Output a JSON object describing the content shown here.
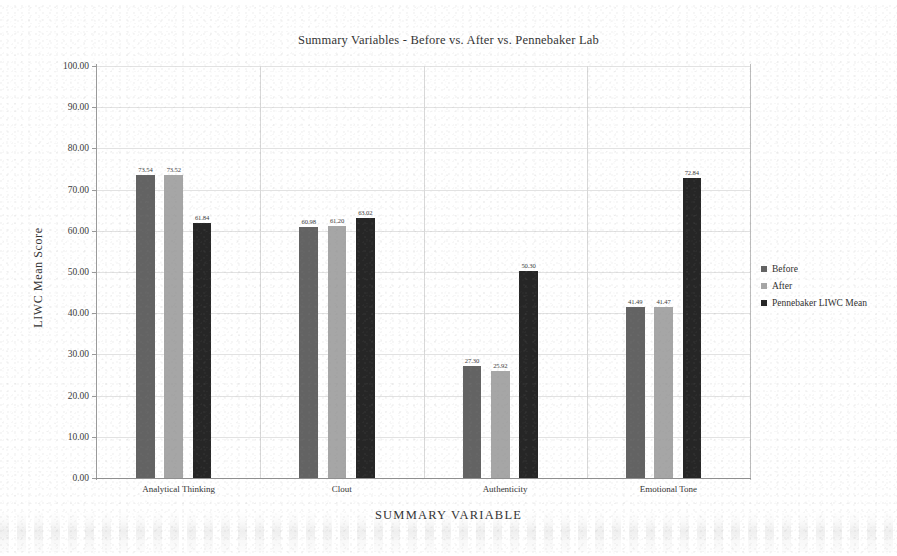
{
  "chart_data": {
    "type": "bar",
    "title": "Summary Variables - Before vs. After vs. Pennebaker Lab",
    "xlabel": "SUMMARY VARIABLE",
    "ylabel": "LIWC Mean Score",
    "categories": [
      "Analytical Thinking",
      "Clout",
      "Authenticity",
      "Emotional Tone"
    ],
    "series": [
      {
        "name": "Before",
        "color": "#636363",
        "values": [
          73.54,
          60.98,
          27.3,
          41.49
        ]
      },
      {
        "name": "After",
        "color": "#a6a6a6",
        "values": [
          73.52,
          61.2,
          25.92,
          41.47
        ]
      },
      {
        "name": "Pennebaker LIWC Mean",
        "color": "#262626",
        "values": [
          61.84,
          63.02,
          50.3,
          72.84
        ]
      }
    ],
    "ylim": [
      0,
      100
    ],
    "yticks": [
      "0.00",
      "10.00",
      "20.00",
      "30.00",
      "40.00",
      "50.00",
      "60.00",
      "70.00",
      "80.00",
      "90.00",
      "100.00"
    ],
    "grid": true,
    "legend_position": "right"
  }
}
